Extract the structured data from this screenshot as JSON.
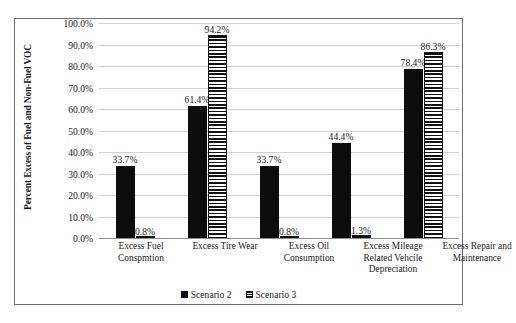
{
  "chart_data": {
    "type": "bar",
    "title": "",
    "xlabel": "",
    "ylabel": "Percent Excess of Fuel and Non-Fuel VOC",
    "ylim": [
      0,
      100
    ],
    "ytick_labels": [
      "100.0%",
      "90.0%",
      "80.0%",
      "70.0%",
      "60.0%",
      "50.0%",
      "40.0%",
      "30.0%",
      "20.0%",
      "10.0%",
      "0.0%"
    ],
    "ytick_values": [
      100,
      90,
      80,
      70,
      60,
      50,
      40,
      30,
      20,
      10,
      0
    ],
    "grid": true,
    "legend_position": "bottom",
    "categories": [
      "Excess Fuel Conspmtion",
      "Excess Tire Wear",
      "Excess Oil Consumption",
      "Excess Mileage Related Vehcile Depreciation",
      "Excess Repair and Maintenance"
    ],
    "series": [
      {
        "name": "Scenario 2",
        "fill": "solid-black",
        "color": "#0d0d0d",
        "values": [
          33.7,
          61.4,
          33.7,
          44.4,
          78.4
        ],
        "labels": [
          "33.7%",
          "61.4%",
          "33.7%",
          "44.4%",
          "78.4%"
        ]
      },
      {
        "name": "Scenario 3",
        "fill": "horizontal-stripes",
        "color": "#111111",
        "values": [
          0.8,
          94.2,
          0.8,
          1.3,
          86.3
        ],
        "labels": [
          "0.8%",
          "94.2%",
          "0.8%",
          "1.3%",
          "86.3%"
        ]
      }
    ]
  },
  "legend": {
    "items": [
      {
        "label": "Scenario 2"
      },
      {
        "label": "Scenario 3"
      }
    ]
  }
}
